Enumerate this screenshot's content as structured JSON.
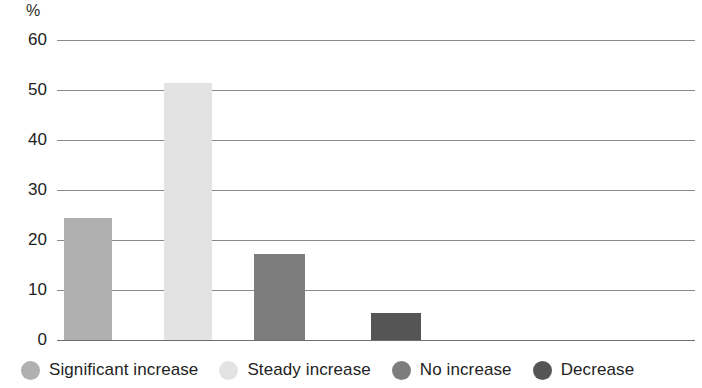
{
  "chart_data": {
    "type": "bar",
    "title": "",
    "subtitle": "",
    "xlabel": "",
    "ylabel": "%",
    "unit_label": "%",
    "categories": [
      "Significant increase",
      "Steady increase",
      "No increase",
      "Decrease"
    ],
    "values": [
      24.5,
      51.5,
      17.3,
      5.5
    ],
    "series": [
      {
        "name": "Share of respondents",
        "values": [
          24.5,
          51.5,
          17.3,
          5.5
        ]
      }
    ],
    "ylim": [
      0,
      60
    ],
    "yticks": [
      0,
      10,
      20,
      30,
      40,
      50,
      60
    ],
    "ytick_labels": [
      "0",
      "10",
      "20",
      "30",
      "40",
      "50",
      "60"
    ],
    "grid": true,
    "grid_axis": "y",
    "legend_position": "bottom",
    "legend": [
      {
        "label": "Significant increase",
        "color": "#b0b0b0",
        "value": 24.5
      },
      {
        "label": "Steady increase",
        "color": "#e3e3e3",
        "value": 51.5
      },
      {
        "label": "No increase",
        "color": "#7d7d7d",
        "value": 17.3
      },
      {
        "label": "Decrease",
        "color": "#555555",
        "value": 5.5
      }
    ],
    "colors": [
      "#b0b0b0",
      "#e3e3e3",
      "#7d7d7d",
      "#555555"
    ],
    "bar_geometry": [
      {
        "left": 64,
        "width": 48
      },
      {
        "left": 164,
        "width": 48
      },
      {
        "left": 254,
        "width": 51
      },
      {
        "left": 371,
        "width": 50
      }
    ],
    "axis_color": "#8a8a8a",
    "background_color": "#ffffff",
    "text_color": "#232323"
  }
}
